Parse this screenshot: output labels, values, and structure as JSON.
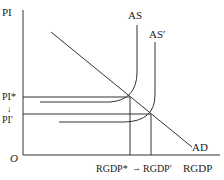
{
  "diagram": {
    "type": "economics-as-ad",
    "axes": {
      "y_label": "PI",
      "x_label": "RGDP",
      "origin": "O"
    },
    "curves": {
      "ad": "AD",
      "as": "AS",
      "as_prime": "AS′"
    },
    "price_levels": {
      "initial": "PI*",
      "new": "PI′",
      "arrow": "↓"
    },
    "output_levels": {
      "initial": "RGDP*",
      "new": "RGDP′",
      "arrow": "→"
    },
    "colors": {
      "line": "#333333",
      "text": "#222222",
      "background": "#ffffff"
    }
  }
}
